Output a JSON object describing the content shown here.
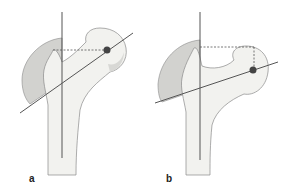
{
  "figure": {
    "panels": [
      {
        "label": "a",
        "description": "Proximal femur, head center above neck axis; dashed horizontal reference line to femoral head center"
      },
      {
        "label": "b",
        "description": "Proximal femur, head center below trochanter tip level; dashed horizontal and vertical reference lines"
      }
    ]
  },
  "colors": {
    "bone_fill": "#f2f2ef",
    "trochanter_shade": "#cfcfcc",
    "outline": "#7a7a7a",
    "axis_line": "#555555",
    "dot": "#444444"
  }
}
